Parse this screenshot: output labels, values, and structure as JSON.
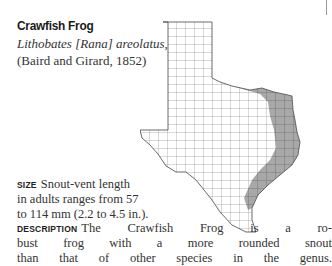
{
  "species": {
    "common_name": "Crawfish Frog",
    "scientific_name": "Lithobates [Rana] areolatus,",
    "authority": "(Baird and Girard, 1852)"
  },
  "map": {
    "description": "Texas county range map",
    "range_region": "East Texas",
    "range_color": "#a8a8a8",
    "outline_color": "#555555"
  },
  "size": {
    "label": "SIZE",
    "lines": [
      "Snout-vent length",
      "in adults ranges from 57",
      "to 114 mm (2.2 to 4.5 in.)."
    ]
  },
  "description": {
    "label": "DESCRIPTION",
    "lines": [
      "The Crawfish Frog is a ro-",
      "bust frog with a more rounded snout",
      "than that of other species in the genus."
    ]
  }
}
